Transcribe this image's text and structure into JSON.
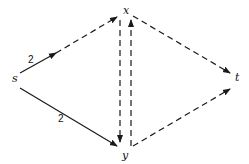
{
  "diagram": {
    "type": "directed-graph",
    "nodes": [
      {
        "id": "s",
        "label": "s"
      },
      {
        "id": "x",
        "label": "x"
      },
      {
        "id": "y",
        "label": "y"
      },
      {
        "id": "t",
        "label": "t"
      }
    ],
    "edges": [
      {
        "from": "s",
        "to": "x",
        "style": "solid-then-dashed",
        "label": "2"
      },
      {
        "from": "s",
        "to": "y",
        "style": "solid",
        "label": "2"
      },
      {
        "from": "x",
        "to": "y",
        "style": "dashed",
        "label": ""
      },
      {
        "from": "y",
        "to": "x",
        "style": "dashed",
        "label": ""
      },
      {
        "from": "x",
        "to": "t",
        "style": "dashed",
        "label": ""
      },
      {
        "from": "y",
        "to": "t",
        "style": "dashed",
        "label": ""
      }
    ],
    "colors": {
      "stroke": "#1a1a1a",
      "background": "#ffffff"
    }
  }
}
